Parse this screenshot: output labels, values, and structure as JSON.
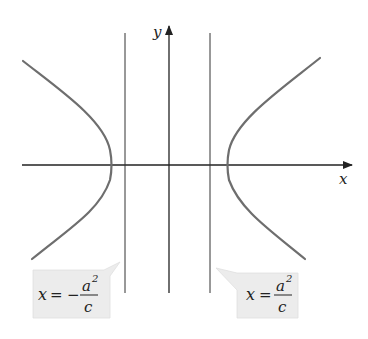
{
  "diagram": {
    "type": "hyperbola-with-directrices",
    "axes": {
      "x_label": "x",
      "y_label": "y"
    },
    "curve_color": "#6e6e6e",
    "axis_color": "#222222",
    "directrix_color": "#333333",
    "callout_fill": "#ececec",
    "callouts": [
      {
        "id": "left-directrix",
        "lhs": "x",
        "equals": "=",
        "sign": "−",
        "numerator": "a",
        "exponent": "2",
        "denominator": "c"
      },
      {
        "id": "right-directrix",
        "lhs": "x",
        "equals": "=",
        "sign": "",
        "numerator": "a",
        "exponent": "2",
        "denominator": "c"
      }
    ]
  }
}
